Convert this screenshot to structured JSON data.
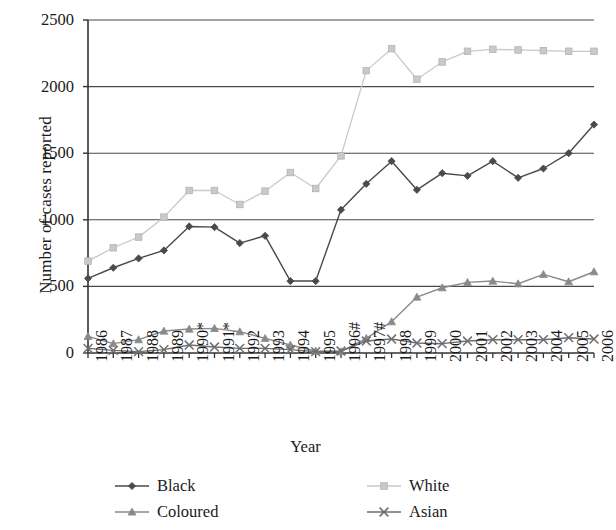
{
  "chart_data": {
    "type": "line",
    "title": "",
    "xlabel": "Year",
    "ylabel": "Number of cases reported",
    "ylim": [
      0,
      2500
    ],
    "ytick_step": 500,
    "yticks": [
      "2500",
      "2000",
      "1500",
      "1000",
      "500",
      "0"
    ],
    "grid": "horizontal",
    "legend_position": "bottom",
    "categories": [
      "1986",
      "1987",
      "1988",
      "1989",
      "1990*",
      "1991*",
      "1992",
      "1993",
      "1994",
      "1995",
      "1996#",
      "1997#",
      "1998",
      "1999",
      "2000",
      "2001",
      "2002",
      "2003",
      "2004",
      "2005",
      "2006"
    ],
    "series": [
      {
        "name": "Black",
        "color": "#4a4a4a",
        "marker": "diamond",
        "values": [
          560,
          640,
          710,
          770,
          950,
          945,
          825,
          880,
          540,
          540,
          1075,
          1270,
          1440,
          1225,
          1350,
          1330,
          1440,
          1315,
          1385,
          1500,
          1715
        ]
      },
      {
        "name": "White",
        "color": "#c9c9c9",
        "marker": "square",
        "values": [
          690,
          790,
          870,
          1020,
          1220,
          1220,
          1115,
          1215,
          1355,
          1235,
          1480,
          2120,
          2285,
          2055,
          2185,
          2265,
          2280,
          2275,
          2270,
          2265,
          2265
        ]
      },
      {
        "name": "Coloured",
        "color": "#8a8a8a",
        "marker": "triangle",
        "values": [
          125,
          70,
          100,
          165,
          180,
          185,
          160,
          110,
          60,
          15,
          10,
          110,
          235,
          420,
          490,
          530,
          540,
          520,
          590,
          535,
          610
        ]
      },
      {
        "name": "Asian",
        "color": "#6e6e6e",
        "marker": "cross",
        "values": [
          35,
          20,
          10,
          25,
          60,
          45,
          35,
          35,
          25,
          10,
          15,
          90,
          105,
          75,
          70,
          90,
          100,
          100,
          100,
          115,
          105
        ]
      }
    ]
  },
  "axis": {
    "x_title": "Year",
    "y_title": "Number of cases reported"
  },
  "legend": {
    "items": [
      {
        "label": "Black",
        "marker": "diamond",
        "color": "#4a4a4a"
      },
      {
        "label": "Coloured",
        "marker": "triangle",
        "color": "#8a8a8a"
      },
      {
        "label": "White",
        "marker": "square",
        "color": "#c9c9c9"
      },
      {
        "label": "Asian",
        "marker": "cross",
        "color": "#6e6e6e"
      }
    ]
  }
}
